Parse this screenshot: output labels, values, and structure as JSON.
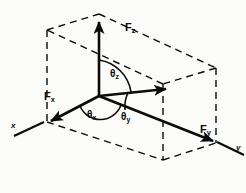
{
  "figure": {
    "type": "vector-decomposition",
    "background_color": "#fbfbfa",
    "ink_color": "#0b0b0b",
    "axes": [
      {
        "name": "x-axis",
        "label": "x"
      },
      {
        "name": "y-axis",
        "label": "y"
      }
    ],
    "force_labels": [
      {
        "name": "fz",
        "base": "F",
        "sub": "z"
      },
      {
        "name": "fx",
        "base": "F",
        "sub": "x"
      },
      {
        "name": "fy",
        "base": "F",
        "sub": "y"
      }
    ],
    "angle_labels": [
      {
        "name": "theta-z",
        "base": "θ",
        "sub": "z"
      },
      {
        "name": "theta-x",
        "base": "θ",
        "sub": "x"
      },
      {
        "name": "theta-y",
        "base": "θ",
        "sub": "y"
      }
    ],
    "geometry": {
      "origin": [
        99,
        96
      ],
      "box_dash_pattern": "7 5",
      "box_stroke_width": 1.4,
      "vector_stroke_width": 2.6,
      "arc_stroke_width": 1.6
    }
  }
}
